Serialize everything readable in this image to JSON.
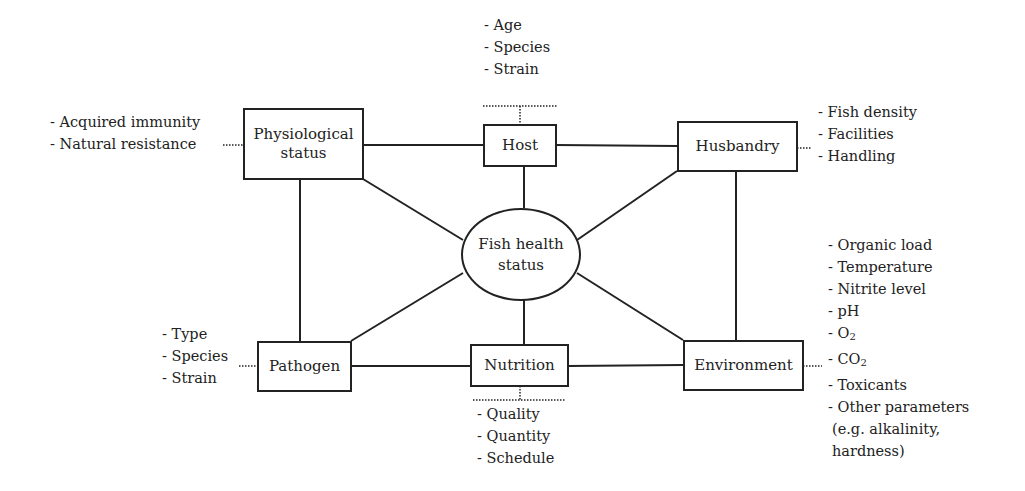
{
  "diagram": {
    "center": {
      "label_line1": "Fish health",
      "label_line2": "status"
    },
    "nodes": {
      "physiological": {
        "label_line1": "Physiological",
        "label_line2": "status",
        "factors": [
          "- Acquired immunity",
          "- Natural resistance"
        ]
      },
      "host": {
        "label": "Host",
        "factors": [
          "- Age",
          "- Species",
          "- Strain"
        ]
      },
      "husbandry": {
        "label": "Husbandry",
        "factors": [
          "- Fish density",
          "- Facilities",
          "- Handling"
        ]
      },
      "pathogen": {
        "label": "Pathogen",
        "factors": [
          "- Type",
          "- Species",
          "- Strain"
        ]
      },
      "nutrition": {
        "label": "Nutrition",
        "factors": [
          "- Quality",
          "- Quantity",
          "- Schedule"
        ]
      },
      "environment": {
        "label": "Environment",
        "factors": [
          "- Organic load",
          "- Temperature",
          "- Nitrite level",
          "- pH",
          "- O",
          "- CO",
          "- Toxicants",
          "- Other parameters",
          "(e.g. alkalinity,",
          "hardness)"
        ],
        "subscript": "2"
      }
    },
    "edges": [
      [
        "physiological",
        "host"
      ],
      [
        "host",
        "husbandry"
      ],
      [
        "physiological",
        "pathogen"
      ],
      [
        "husbandry",
        "environment"
      ],
      [
        "pathogen",
        "nutrition"
      ],
      [
        "nutrition",
        "environment"
      ],
      [
        "center",
        "host"
      ],
      [
        "center",
        "physiological"
      ],
      [
        "center",
        "husbandry"
      ],
      [
        "center",
        "pathogen"
      ],
      [
        "center",
        "nutrition"
      ],
      [
        "center",
        "environment"
      ]
    ],
    "colors": {
      "line": "#222222",
      "background": "#ffffff"
    }
  }
}
